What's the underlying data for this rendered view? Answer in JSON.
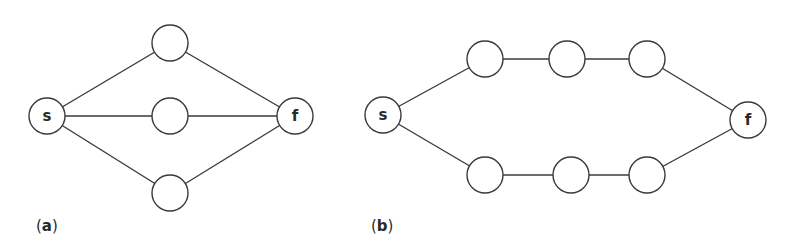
{
  "panels": [
    {
      "id": "a",
      "label_open": "(",
      "label_letter": "a",
      "label_close": ")",
      "label_pos": [
        36,
        217
      ],
      "nodes": [
        {
          "id": "s",
          "label": "s",
          "x": 47,
          "y": 116
        },
        {
          "id": "top",
          "label": "",
          "x": 170,
          "y": 43
        },
        {
          "id": "mid",
          "label": "",
          "x": 170,
          "y": 116
        },
        {
          "id": "bot",
          "label": "",
          "x": 170,
          "y": 193
        },
        {
          "id": "f",
          "label": "f",
          "x": 295,
          "y": 116
        }
      ],
      "edges": [
        [
          "s",
          "top"
        ],
        [
          "s",
          "mid"
        ],
        [
          "s",
          "bot"
        ],
        [
          "top",
          "f"
        ],
        [
          "mid",
          "f"
        ],
        [
          "bot",
          "f"
        ]
      ]
    },
    {
      "id": "b",
      "label_open": "(",
      "label_letter": "b",
      "label_close": ")",
      "label_pos": [
        371,
        217
      ],
      "nodes": [
        {
          "id": "s",
          "label": "s",
          "x": 383,
          "y": 115
        },
        {
          "id": "t1",
          "label": "",
          "x": 485,
          "y": 59
        },
        {
          "id": "t2",
          "label": "",
          "x": 567,
          "y": 59
        },
        {
          "id": "t3",
          "label": "",
          "x": 647,
          "y": 59
        },
        {
          "id": "b1",
          "label": "",
          "x": 485,
          "y": 175
        },
        {
          "id": "b2",
          "label": "",
          "x": 571,
          "y": 175
        },
        {
          "id": "b3",
          "label": "",
          "x": 647,
          "y": 175
        },
        {
          "id": "f",
          "label": "f",
          "x": 748,
          "y": 120
        }
      ],
      "edges": [
        [
          "s",
          "t1"
        ],
        [
          "t1",
          "t2"
        ],
        [
          "t2",
          "t3"
        ],
        [
          "t3",
          "f"
        ],
        [
          "s",
          "b1"
        ],
        [
          "b1",
          "b2"
        ],
        [
          "b2",
          "b3"
        ],
        [
          "b3",
          "f"
        ]
      ]
    }
  ],
  "style": {
    "node_radius": 18,
    "stroke_color": "#3a3a3a",
    "background": "#ffffff"
  }
}
